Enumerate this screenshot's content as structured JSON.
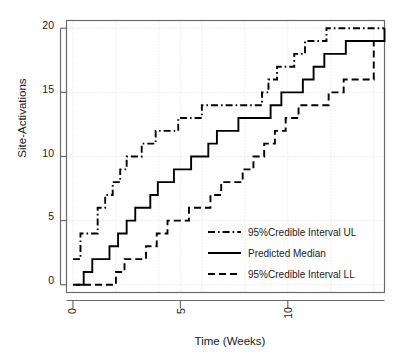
{
  "chart_data": {
    "type": "line",
    "title": "",
    "subtitle": "",
    "xlabel": "Time (Weeks)",
    "ylabel": "Site-Activations",
    "xlim": [
      -0.3,
      14.5
    ],
    "ylim": [
      -0.6,
      20.6
    ],
    "xticks": [
      0,
      5,
      10
    ],
    "xticklabels": [
      "0",
      "5",
      "10"
    ],
    "yticks": [
      0,
      5,
      10,
      15,
      20
    ],
    "yticklabels": [
      "0",
      "5",
      "10",
      "15",
      "20"
    ],
    "grid": true,
    "grid_style": "dotted",
    "legend_position": "lower right",
    "step_type": "post",
    "series": [
      {
        "name": "95%Credible Interval UL",
        "dash": "dash-dot",
        "color": "#000000",
        "x": [
          0.0,
          0.35,
          0.75,
          1.15,
          1.5,
          1.85,
          2.2,
          2.5,
          2.85,
          3.2,
          3.5,
          3.85,
          4.2,
          4.55,
          4.9,
          5.2,
          5.6,
          6.0,
          6.4,
          7.9,
          8.8,
          9.1,
          9.5,
          9.9,
          10.3,
          10.8,
          11.3,
          11.8,
          14.5
        ],
        "y": [
          2,
          4,
          4,
          6,
          7,
          8,
          9,
          10,
          10,
          11,
          11,
          12,
          12,
          12,
          13,
          13,
          13,
          14,
          14,
          14,
          15,
          16,
          17,
          17,
          18,
          19,
          19,
          20,
          20
        ]
      },
      {
        "name": "Predicted Median",
        "dash": "solid",
        "color": "#000000",
        "x": [
          0.15,
          0.5,
          0.9,
          1.3,
          1.7,
          2.1,
          2.5,
          2.9,
          3.25,
          3.6,
          3.95,
          4.3,
          4.7,
          5.1,
          5.5,
          5.9,
          6.3,
          6.7,
          7.2,
          7.7,
          8.2,
          8.7,
          9.2,
          9.7,
          10.2,
          10.7,
          11.2,
          11.7,
          12.2,
          12.7,
          14.5
        ],
        "y": [
          0,
          1,
          2,
          2,
          3,
          4,
          5,
          6,
          6,
          7,
          8,
          8,
          9,
          9,
          10,
          10,
          11,
          12,
          12,
          13,
          13,
          13,
          14,
          15,
          15,
          16,
          17,
          18,
          18,
          19,
          20
        ]
      },
      {
        "name": "95%Credible Interval LL",
        "dash": "dashed",
        "color": "#000000",
        "x": [
          0.0,
          1.6,
          2.0,
          2.4,
          2.9,
          3.4,
          3.9,
          4.4,
          4.9,
          5.4,
          5.9,
          6.4,
          6.9,
          7.4,
          7.9,
          8.4,
          8.9,
          9.4,
          9.9,
          10.5,
          11.2,
          11.9,
          12.6,
          13.3,
          14.0,
          14.5
        ],
        "y": [
          0,
          0,
          1,
          2,
          2,
          3,
          4,
          5,
          5,
          6,
          6,
          7,
          8,
          8,
          9,
          10,
          11,
          12,
          13,
          14,
          14,
          15,
          16,
          16,
          19,
          19
        ]
      }
    ]
  },
  "axes": {
    "ylabel": "Site-Activations",
    "xlabel": "Time (Weeks)",
    "y_ticks": [
      "0",
      "5",
      "10",
      "15",
      "20"
    ],
    "x_ticks": [
      "0",
      "5",
      "10"
    ]
  },
  "legend": {
    "entries": [
      {
        "label": "95%Credible Interval UL",
        "dash": "dash-dot"
      },
      {
        "label": "Predicted Median",
        "dash": "solid"
      },
      {
        "label": "95%Credible Interval LL",
        "dash": "dashed"
      }
    ]
  },
  "colors": {
    "line": "#000000",
    "axis": "#555555",
    "grid": "#d8d8d8",
    "background": "#ffffff"
  }
}
